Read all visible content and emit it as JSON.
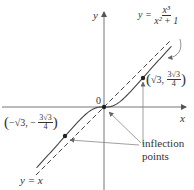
{
  "diagram": {
    "axes": {
      "x_label": "x",
      "y_label": "y",
      "origin_label": "0"
    },
    "function_label": {
      "lhs": "y =",
      "numerator": "x³",
      "denominator": "x² + 1"
    },
    "asymptote_label": "y = x",
    "points": [
      {
        "name": "right-inflection",
        "label_x": "√3,",
        "label_y_num": "3√3",
        "label_y_den": "4",
        "x": 1.732,
        "y": 1.299
      },
      {
        "name": "left-inflection",
        "label_x": "−√3,",
        "label_y_sign": "−",
        "label_y_num": "3√3",
        "label_y_den": "4",
        "x": -1.732,
        "y": -1.299
      },
      {
        "name": "origin",
        "x": 0,
        "y": 0
      }
    ],
    "annotation": {
      "line1": "inflection",
      "line2": "points"
    },
    "colors": {
      "curve": "#444444",
      "axis": "#777777",
      "text": "#333333",
      "pointer": "#888888"
    }
  },
  "chart_data": {
    "type": "line",
    "xlabel": "x",
    "ylabel": "y",
    "xlim": [
      -4.1,
      3.6
    ],
    "ylim": [
      -3.7,
      4.3
    ],
    "series": [
      {
        "name": "y = x^3/(x^2+1)",
        "style": "solid",
        "x": [
          -3,
          -2.5,
          -2,
          -1.732,
          -1.5,
          -1,
          -0.5,
          0,
          0.5,
          1,
          1.5,
          1.732,
          2,
          2.5,
          3
        ],
        "values": [
          -2.7,
          -2.155,
          -1.6,
          -1.299,
          -1.038,
          -0.5,
          -0.1,
          0,
          0.1,
          0.5,
          1.038,
          1.299,
          1.6,
          2.155,
          2.7
        ]
      },
      {
        "name": "y = x",
        "style": "dashed",
        "x": [
          -3,
          3
        ],
        "values": [
          -3,
          3
        ]
      }
    ],
    "annotations": [
      "(√3, 3√3/4)",
      "(−√3, −3√3/4)",
      "inflection points",
      "y = x"
    ],
    "grid": false,
    "legend": "none"
  }
}
